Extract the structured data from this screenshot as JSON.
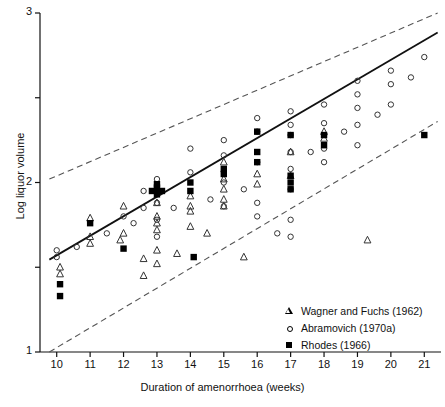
{
  "chart_data": {
    "type": "scatter",
    "title": "",
    "xlabel": "Duration of amenorrhoea (weeks)",
    "ylabel": "Log liquor volume",
    "xlim": [
      9.5,
      21.5
    ],
    "ylim": [
      1.0,
      3.0
    ],
    "xticks": [
      10,
      11,
      12,
      13,
      14,
      15,
      16,
      17,
      18,
      19,
      20,
      21
    ],
    "xticklabels": [
      "10",
      "11",
      "12",
      "13",
      "14",
      "15",
      "16",
      "17",
      "18",
      "19",
      "20",
      "21"
    ],
    "yticks": [
      1.0,
      1.5,
      2.0,
      2.5,
      3.0
    ],
    "yticklabels": [
      "1",
      "",
      "2",
      "",
      "3"
    ],
    "ylabels_shown": [
      "1",
      "2",
      "3"
    ],
    "grid": false,
    "legend_position": "lower-right",
    "legend": [
      {
        "key": "wagner",
        "marker": "triangle-open",
        "label": "Wagner and Fuchs (1962)"
      },
      {
        "key": "abramovich",
        "marker": "circle-open",
        "label": "Abramovich (1970a)"
      },
      {
        "key": "rhodes",
        "marker": "square-filled",
        "label": "Rhodes (1966)"
      }
    ],
    "lines": [
      {
        "name": "regression",
        "style": "solid",
        "x": [
          9.78,
          21.4
        ],
        "y": [
          1.545,
          2.885
        ]
      },
      {
        "name": "upper-limit",
        "style": "dashed",
        "x": [
          9.78,
          21.4
        ],
        "y": [
          2.02,
          3.0
        ]
      },
      {
        "name": "lower-limit",
        "style": "dashed",
        "x": [
          9.78,
          21.4
        ],
        "y": [
          1.0,
          2.36
        ]
      }
    ],
    "series": [
      {
        "name": "Wagner and Fuchs (1962)",
        "marker": "triangle-open",
        "points": [
          [
            10.1,
            1.5
          ],
          [
            10.1,
            1.46
          ],
          [
            11.0,
            1.79
          ],
          [
            11.0,
            1.68
          ],
          [
            11.0,
            1.64
          ],
          [
            11.9,
            1.66
          ],
          [
            12.0,
            1.86
          ],
          [
            12.0,
            1.7
          ],
          [
            12.6,
            1.55
          ],
          [
            12.6,
            1.45
          ],
          [
            13.0,
            1.88
          ],
          [
            13.0,
            1.8
          ],
          [
            13.0,
            1.76
          ],
          [
            13.0,
            1.72
          ],
          [
            13.0,
            1.6
          ],
          [
            13.0,
            1.52
          ],
          [
            13.6,
            1.58
          ],
          [
            14.0,
            1.92
          ],
          [
            14.0,
            1.86
          ],
          [
            14.0,
            1.83
          ],
          [
            14.0,
            1.74
          ],
          [
            14.5,
            1.7
          ],
          [
            15.0,
            2.12
          ],
          [
            15.0,
            2.02
          ],
          [
            15.0,
            1.96
          ],
          [
            15.0,
            1.9
          ],
          [
            15.0,
            1.86
          ],
          [
            15.6,
            1.56
          ],
          [
            16.0,
            2.05
          ],
          [
            16.0,
            1.99
          ],
          [
            17.0,
            2.18
          ],
          [
            17.0,
            2.04
          ],
          [
            18.0,
            2.3
          ],
          [
            18.0,
            2.26
          ],
          [
            19.3,
            1.66
          ]
        ]
      },
      {
        "name": "Abramovich (1970a)",
        "marker": "circle-open",
        "points": [
          [
            10.0,
            1.6
          ],
          [
            10.0,
            1.56
          ],
          [
            10.6,
            1.62
          ],
          [
            11.5,
            1.7
          ],
          [
            12.0,
            1.8
          ],
          [
            12.3,
            1.76
          ],
          [
            12.6,
            1.95
          ],
          [
            12.6,
            1.85
          ],
          [
            13.0,
            2.02
          ],
          [
            13.0,
            1.88
          ],
          [
            13.0,
            1.78
          ],
          [
            13.0,
            1.68
          ],
          [
            13.5,
            1.85
          ],
          [
            14.0,
            2.2
          ],
          [
            14.0,
            2.06
          ],
          [
            14.6,
            1.9
          ],
          [
            15.0,
            2.25
          ],
          [
            15.0,
            2.16
          ],
          [
            15.0,
            2.0
          ],
          [
            15.0,
            1.86
          ],
          [
            15.6,
            1.96
          ],
          [
            16.0,
            2.38
          ],
          [
            16.0,
            2.3
          ],
          [
            16.0,
            2.12
          ],
          [
            16.0,
            1.88
          ],
          [
            16.0,
            1.8
          ],
          [
            16.6,
            1.7
          ],
          [
            17.0,
            2.42
          ],
          [
            17.0,
            2.34
          ],
          [
            17.0,
            2.28
          ],
          [
            17.0,
            2.18
          ],
          [
            17.0,
            2.08
          ],
          [
            17.0,
            1.96
          ],
          [
            17.0,
            1.78
          ],
          [
            17.0,
            1.68
          ],
          [
            17.6,
            2.18
          ],
          [
            18.0,
            2.46
          ],
          [
            18.0,
            2.35
          ],
          [
            18.0,
            2.28
          ],
          [
            18.0,
            2.2
          ],
          [
            18.0,
            2.12
          ],
          [
            18.6,
            2.3
          ],
          [
            19.0,
            2.6
          ],
          [
            19.0,
            2.52
          ],
          [
            19.0,
            2.44
          ],
          [
            19.0,
            2.34
          ],
          [
            19.0,
            2.22
          ],
          [
            19.6,
            2.4
          ],
          [
            20.0,
            2.66
          ],
          [
            20.0,
            2.58
          ],
          [
            20.0,
            2.46
          ],
          [
            20.6,
            2.62
          ],
          [
            21.0,
            2.74
          ]
        ]
      },
      {
        "name": "Rhodes (1966)",
        "marker": "square-filled",
        "points": [
          [
            10.1,
            1.4
          ],
          [
            10.1,
            1.33
          ],
          [
            11.0,
            1.76
          ],
          [
            12.0,
            1.61
          ],
          [
            13.0,
            1.97
          ],
          [
            13.0,
            1.95
          ],
          [
            13.0,
            1.93
          ],
          [
            12.85,
            1.95
          ],
          [
            13.15,
            1.95
          ],
          [
            13.0,
            1.99
          ],
          [
            14.0,
            2.0
          ],
          [
            14.0,
            1.95
          ],
          [
            14.1,
            1.56
          ],
          [
            15.0,
            2.08
          ],
          [
            15.0,
            2.05
          ],
          [
            16.0,
            2.3
          ],
          [
            16.0,
            2.18
          ],
          [
            16.0,
            2.12
          ],
          [
            17.0,
            2.28
          ],
          [
            17.0,
            2.04
          ],
          [
            17.0,
            2.0
          ],
          [
            17.0,
            1.96
          ],
          [
            18.0,
            2.28
          ],
          [
            18.0,
            2.22
          ],
          [
            21.0,
            2.28
          ]
        ]
      }
    ]
  },
  "axis": {
    "ylabel_text": "Log liquor volume",
    "xlabel_text": "Duration of amenorrhoea (weeks)"
  }
}
